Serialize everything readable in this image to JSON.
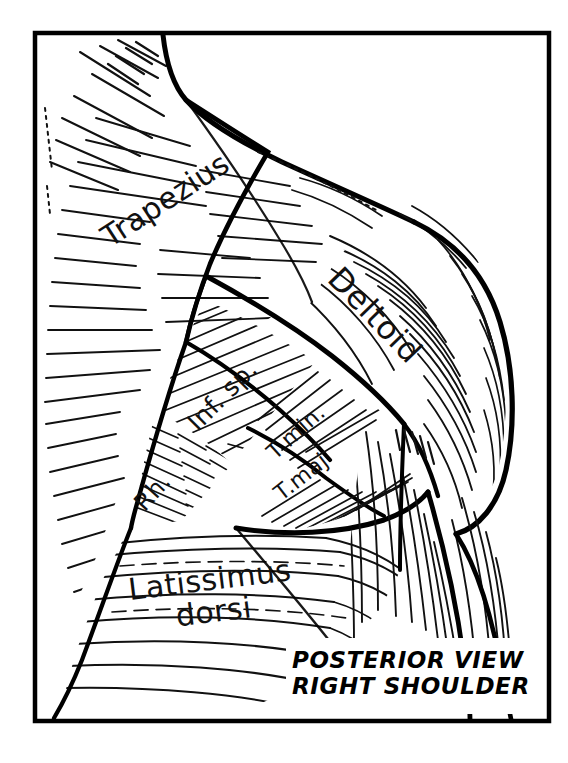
{
  "figure": {
    "style": "black-and-white pen-and-ink anatomical line drawing with hatching",
    "background_color": "#ffffff",
    "ink_color": "#000000",
    "frame": {
      "name": "illustration-border",
      "x": 35,
      "y": 33,
      "width": 514,
      "height": 688,
      "stroke_color": "#000000",
      "stroke_width": 4
    }
  },
  "caption": {
    "line1": "POSTERIOR VIEW",
    "line2": "RIGHT SHOULDER",
    "x": 292,
    "y": 648,
    "font_size": 23,
    "color": "#000000"
  },
  "labels": [
    {
      "id": "trapezius",
      "text": "Trapezius",
      "x": 165,
      "y": 200,
      "rotation": -33,
      "font_size": 30,
      "lines": 1
    },
    {
      "id": "deltoid",
      "text": "Deltoid",
      "x": 375,
      "y": 315,
      "rotation": 46,
      "font_size": 32,
      "lines": 1
    },
    {
      "id": "infraspinatus",
      "text": "Inf. sp.",
      "x": 222,
      "y": 395,
      "rotation": -45,
      "font_size": 25,
      "lines": 1
    },
    {
      "id": "teres-minor",
      "text": "T.min.",
      "x": 296,
      "y": 432,
      "rotation": -42,
      "font_size": 22,
      "lines": 1
    },
    {
      "id": "teres-major",
      "text": "T.maj",
      "x": 301,
      "y": 477,
      "rotation": -38,
      "font_size": 22,
      "lines": 1
    },
    {
      "id": "rhomboid",
      "text": "Rh.",
      "x": 152,
      "y": 492,
      "rotation": -48,
      "font_size": 24,
      "lines": 1
    },
    {
      "id": "latissimus-dorsi",
      "text": "Latissimus dorsi",
      "line1": "Latissimus",
      "line2": "dorsi",
      "x": 212,
      "y": 596,
      "rotation": -7,
      "font_size": 30,
      "lines": 2
    }
  ],
  "muscles": [
    {
      "id": "trapezius",
      "label": "Trapezius",
      "region": "upper-left",
      "hatching": "fine parallel strokes radiating toward upper right along fiber direction"
    },
    {
      "id": "deltoid",
      "label": "Deltoid",
      "region": "upper-right",
      "hatching": "long curving fibers converging downward to the humeral insertion"
    },
    {
      "id": "infraspinatus",
      "label": "Inf. sp.",
      "region": "center",
      "hatching": "dense diagonal hatching"
    },
    {
      "id": "teres-minor",
      "label": "T.min.",
      "region": "center-right",
      "hatching": "diagonal hatching within a narrow band"
    },
    {
      "id": "teres-major",
      "label": "T.maj",
      "region": "center-right-lower",
      "hatching": "diagonal hatching within a broader band"
    },
    {
      "id": "rhomboid",
      "label": "Rh.",
      "region": "center-left-lower",
      "hatching": "herringbone feather hatching"
    },
    {
      "id": "latissimus-dorsi",
      "label": "Latissimus dorsi",
      "region": "lower",
      "hatching": "long sweeping near-horizontal lines converging to the right"
    },
    {
      "id": "triceps",
      "label": "",
      "region": "lower-right arm",
      "hatching": "long vertical fibers along the posterior arm"
    }
  ]
}
